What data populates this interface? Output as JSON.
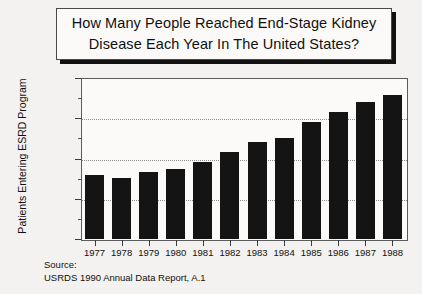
{
  "title": {
    "line1": "How Many People Reached End-Stage Kidney",
    "line2": "Disease Each Year In The United States?"
  },
  "source": {
    "label": "Source:",
    "citation": "USRDS 1990 Annual Data Report, A.1"
  },
  "chart_data": {
    "type": "bar",
    "title": "How Many People Reached End-Stage Kidney Disease Each Year In The United States?",
    "xlabel": "",
    "ylabel": "Patients Entering ESRD Program",
    "categories": [
      "1977",
      "1978",
      "1979",
      "1980",
      "1981",
      "1982",
      "1983",
      "1984",
      "1985",
      "1986",
      "1987",
      "1988"
    ],
    "values": [
      15900,
      15200,
      16700,
      17400,
      19100,
      21500,
      24100,
      25100,
      29000,
      31500,
      34000,
      35800
    ],
    "ylim": [
      0,
      40000
    ],
    "ytick_values": [
      0,
      10000,
      20000,
      30000,
      40000
    ],
    "ytick_labels": [
      "0",
      "10,000",
      "20,000",
      "30,000",
      "40,000"
    ],
    "gridlines": [
      "10,000",
      "20,000",
      "30,000"
    ],
    "grid": true,
    "legend": "none",
    "bar_color": "#141414"
  }
}
